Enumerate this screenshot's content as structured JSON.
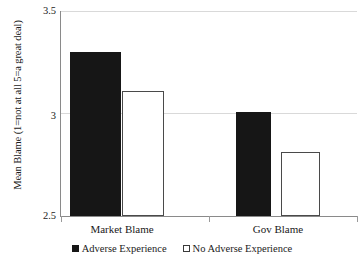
{
  "chart_data": {
    "type": "bar",
    "title": "",
    "xlabel": "",
    "ylabel": "Mean Blame (1=not at all 5=a great deal)",
    "categories": [
      "Market Blame",
      "Gov Blame"
    ],
    "series": [
      {
        "name": "Adverse Experience",
        "values": [
          3.3,
          3.01
        ],
        "color": "#161616",
        "style": "filled"
      },
      {
        "name": "No Adverse Experience",
        "values": [
          3.11,
          2.81
        ],
        "color": "#ffffff",
        "style": "hollow"
      }
    ],
    "ylim": [
      2.5,
      3.5
    ],
    "yticks": [
      2.5,
      3.0,
      3.5
    ],
    "ytick_labels": [
      "2.5",
      "3",
      "3.5"
    ],
    "grid": "horizontal",
    "legend_position": "bottom"
  },
  "axis": {
    "y_title": "Mean Blame (1=not at all 5=a great deal)",
    "tick_top": "3.5",
    "tick_mid": "3",
    "tick_bottom": "2.5"
  },
  "categories": {
    "first": "Market Blame",
    "second": "Gov Blame"
  },
  "legend": {
    "items": [
      {
        "label": "Adverse Experience"
      },
      {
        "label": "No Adverse Experience"
      }
    ]
  }
}
